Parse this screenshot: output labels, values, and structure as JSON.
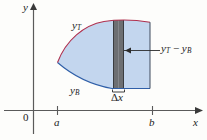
{
  "figure": {
    "background_color": "#fdfdfb",
    "axes": {
      "y_axis_label": "y",
      "x_axis_label": "x",
      "origin_label": "0",
      "axis_color": "#5a5a5a",
      "x_axis_y_px": 110,
      "y_axis_x_px": 33,
      "ticks": [
        {
          "label": "a",
          "x_px": 57
        },
        {
          "label": "b",
          "x_px": 152
        }
      ]
    },
    "curves": {
      "top_label": "y",
      "top_label_sub": "T",
      "top_color": "#b0304e",
      "bottom_label": "y",
      "bottom_label_sub": "B",
      "bottom_color": "#2f5fa8"
    },
    "region": {
      "fill_color": "#c3d6ee",
      "opacity": 1
    },
    "strip": {
      "fill_color": "#6d6f72",
      "edge_color": "#3a3c3f",
      "left_px": 113,
      "right_px": 124,
      "width_label_delta": "Δ",
      "width_label_var": "x",
      "brace_color": "#2b2b2b"
    },
    "annotation": {
      "label_lead": "y",
      "label_lead_sub": "T",
      "label_minus": "−",
      "label_trail": "y",
      "label_trail_sub": "B",
      "leader_color": "#2b2b2b",
      "arrow_tip_x_px": 127,
      "arrow_y_px": 50
    }
  }
}
